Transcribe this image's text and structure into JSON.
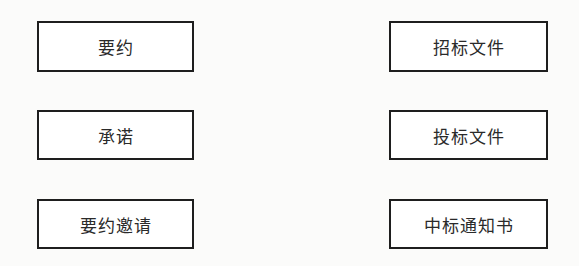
{
  "diagram": {
    "left_column": [
      {
        "label": "要约"
      },
      {
        "label": "承诺"
      },
      {
        "label": "要约邀请"
      }
    ],
    "right_column": [
      {
        "label": "招标文件"
      },
      {
        "label": "投标文件"
      },
      {
        "label": "中标通知书"
      }
    ]
  }
}
